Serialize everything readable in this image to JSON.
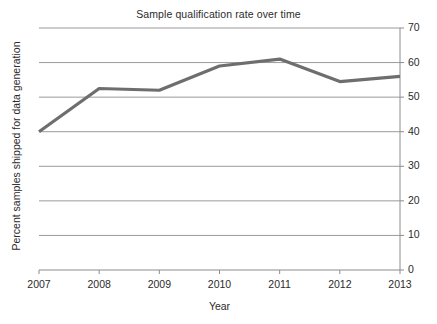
{
  "chart_data": {
    "type": "line",
    "title": "Sample qualification rate over time",
    "xlabel": "Year",
    "ylabel": "Percent samples shipped for data generation",
    "x": [
      2007,
      2008,
      2009,
      2010,
      2011,
      2012,
      2013
    ],
    "categories": [
      "2007",
      "2008",
      "2009",
      "2010",
      "2011",
      "2012",
      "2013"
    ],
    "values": [
      40,
      52.5,
      52,
      59,
      61,
      54.5,
      56
    ],
    "series": [
      {
        "name": "Percent samples shipped for data generation",
        "values": [
          40,
          52.5,
          52,
          59,
          61,
          54.5,
          56
        ]
      }
    ],
    "ylim": [
      0,
      70
    ],
    "xlim": [
      2007,
      2013
    ],
    "y_ticks": [
      0,
      10,
      20,
      30,
      40,
      50,
      60,
      70
    ],
    "y_tick_labels": [
      "0",
      "10",
      "20",
      "30",
      "40",
      "50",
      "60",
      "70"
    ],
    "x_ticks": [
      2007,
      2008,
      2009,
      2010,
      2011,
      2012,
      2013
    ],
    "x_tick_labels": [
      "2007",
      "2008",
      "2009",
      "2010",
      "2011",
      "2012",
      "2013"
    ],
    "grid": "horizontal",
    "y_axis_position": "right",
    "legend": "none",
    "line_color": "#6e6e6e",
    "grid_color": "#9a9a9a",
    "axis_color": "#8c8c8c",
    "background_color": "#ffffff"
  }
}
